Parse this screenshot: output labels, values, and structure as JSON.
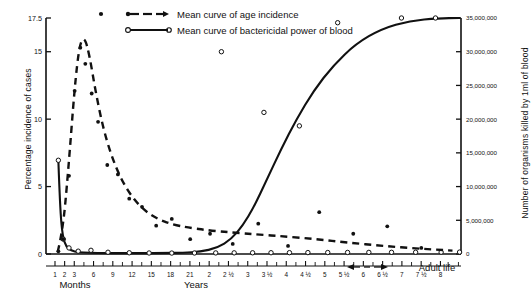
{
  "chart_data": {
    "type": "scatter",
    "title": "",
    "subtitle": "",
    "xlabel": "",
    "ylabel": "Percentage incidence of cases",
    "ylabel_right": "Number of organisms killed by 1ml of blood",
    "grid": false,
    "legend_position": "top-center",
    "xlim": [
      0,
      29
    ],
    "ylim": [
      0,
      17.5
    ],
    "ylim_right": [
      0,
      35000000
    ],
    "y_ticks_left": [
      "0",
      "5",
      "10",
      "15",
      "17.5"
    ],
    "y_tick_values_left": [
      0,
      5,
      10,
      15,
      17.5
    ],
    "y_ticks_right": [
      "0",
      "5,000,000",
      "10,000,000",
      "15,000,000",
      "20,000,000",
      "25,000,000",
      "30,000,000",
      "35,000,000"
    ],
    "y_tick_values_right": [
      0,
      5000000,
      10000000,
      15000000,
      20000000,
      25000000,
      30000000,
      35000000
    ],
    "x_tick_labels": [
      "1",
      "2",
      "3",
      "6",
      "9",
      "12",
      "15",
      "18",
      "21",
      "2",
      "2 ½",
      "3",
      "3 ½",
      "4",
      "4 ½",
      "5",
      "5 ½",
      "6",
      "6 ½",
      "7",
      "7 ½",
      "8"
    ],
    "x_group_months": "Months",
    "x_group_years": "Years",
    "x_adult_label": "Adult life",
    "legend": [
      {
        "name": "Mean curve of age incidence",
        "style": "dashed",
        "marker": "filled-circle"
      },
      {
        "name": "Mean curve of bactericidal power of blood",
        "style": "solid",
        "marker": "open-circle"
      }
    ],
    "series": [
      {
        "name": "Mean curve of age incidence",
        "style": "dashed",
        "marker": "filled-circle",
        "curve_x": [
          0.55,
          0.9,
          1.3,
          1.75,
          2.1,
          2.45,
          2.8,
          3.2,
          3.7,
          4.3,
          5.0,
          5.8,
          6.7,
          7.6,
          8.6,
          9.8,
          11.2,
          12.8,
          14.6,
          16.6,
          18.8,
          21.0,
          23.5,
          26.0,
          28.4
        ],
        "curve_y": [
          0.15,
          1.6,
          6.2,
          12.4,
          15.6,
          16.1,
          14.7,
          12.2,
          9.6,
          7.4,
          5.6,
          4.2,
          3.2,
          2.6,
          2.2,
          1.95,
          1.75,
          1.6,
          1.45,
          1.3,
          1.1,
          0.85,
          0.6,
          0.4,
          0.25
        ],
        "points_x": [
          0.6,
          0.95,
          1.35,
          1.75,
          2.15,
          2.5,
          2.95,
          3.4,
          4.05,
          4.8,
          5.6,
          6.5,
          7.5,
          8.6,
          9.9,
          11.3,
          12.9,
          14.7,
          16.8,
          19.0,
          21.4,
          23.8,
          26.2
        ],
        "points_y": [
          0.2,
          1.1,
          5.8,
          12.1,
          15.3,
          14.1,
          11.9,
          9.8,
          6.6,
          5.9,
          4.1,
          3.5,
          2.1,
          2.6,
          1.1,
          1.5,
          0.75,
          2.25,
          0.6,
          3.1,
          1.5,
          2.05,
          0.45
        ]
      },
      {
        "name": "Mean curve of bactericidal power of blood",
        "style": "solid",
        "marker": "open-circle",
        "curve_x": [
          0.6,
          0.72,
          0.9,
          1.15,
          1.5,
          2.0,
          2.8,
          3.9,
          5.2,
          6.6,
          8.0,
          9.4,
          10.6,
          11.8,
          12.8,
          13.6,
          14.4,
          15.3,
          16.3,
          17.4,
          18.6,
          20.0,
          21.6,
          23.4,
          25.4,
          27.4,
          28.9
        ],
        "curve_y_right": [
          13900000,
          6800000,
          2600000,
          1100000,
          500000,
          260000,
          170000,
          140000,
          130000,
          130000,
          140000,
          180000,
          320000,
          900000,
          2200000,
          4200000,
          7000000,
          11000000,
          15500000,
          20000000,
          24200000,
          28000000,
          31200000,
          33400000,
          34600000,
          34950000,
          35000000
        ],
        "points_x": [
          0.6,
          0.95,
          1.35,
          2.0,
          2.9,
          4.1,
          5.6,
          7.0,
          8.6,
          10.2,
          11.7,
          13.0,
          14.3,
          15.6,
          16.9,
          18.2,
          19.6,
          21.0,
          22.5,
          24.1,
          25.8,
          27.6,
          28.9,
          12.1,
          15.1,
          17.6,
          20.3,
          24.8,
          27.2
        ],
        "points_y_right": [
          13900000,
          2200000,
          900000,
          420000,
          550000,
          260000,
          180000,
          150000,
          140000,
          150000,
          160000,
          170000,
          180000,
          190000,
          200000,
          210000,
          220000,
          230000,
          240000,
          250000,
          260000,
          270000,
          280000,
          30000000,
          21000000,
          19000000,
          34300000,
          35000000,
          35000000
        ]
      }
    ]
  }
}
